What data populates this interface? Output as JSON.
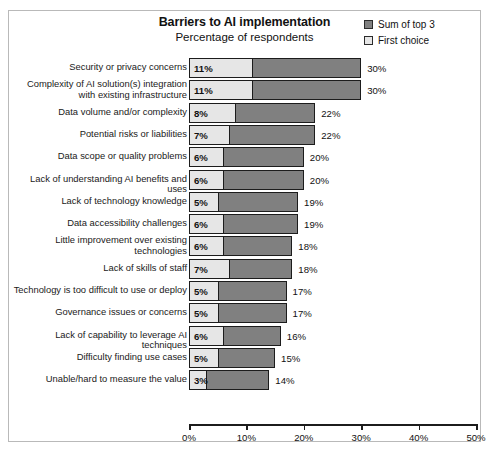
{
  "chart_data": {
    "type": "bar",
    "orientation": "horizontal",
    "stacked": true,
    "title": "Barriers to AI implementation",
    "subtitle": "Percentage of respondents",
    "xlabel": "",
    "ylabel": "",
    "xlim": [
      0,
      50
    ],
    "xticks": [
      "0%",
      "10%",
      "20%",
      "30%",
      "40%",
      "50%"
    ],
    "xtick_values": [
      0,
      10,
      20,
      30,
      40,
      50
    ],
    "grid": false,
    "legend_position": "top-right",
    "legend": [
      {
        "name": "Sum of top 3",
        "color": "#808080"
      },
      {
        "name": "First choice",
        "color": "#e6e6e6"
      }
    ],
    "categories": [
      "Security or privacy concerns",
      "Complexity of AI solution(s) integration with existing infrastructure",
      "Data volume and/or complexity",
      "Potential risks or liabilities",
      "Data scope or quality problems",
      "Lack of understanding AI benefits and uses",
      "Lack of technology knowledge",
      "Data accessibility challenges",
      "Little improvement over existing technologies",
      "Lack of skills of staff",
      "Technology is too difficult to use or deploy",
      "Governance issues or concerns",
      "Lack of capability to leverage AI techniques",
      "Difficulty finding use cases",
      "Unable/hard to measure the value"
    ],
    "series": [
      {
        "name": "First choice",
        "values": [
          11,
          11,
          8,
          7,
          6,
          6,
          5,
          6,
          6,
          7,
          5,
          5,
          6,
          5,
          3
        ],
        "labels": [
          "11%",
          "11%",
          "8%",
          "7%",
          "6%",
          "6%",
          "5%",
          "6%",
          "6%",
          "7%",
          "5%",
          "5%",
          "6%",
          "5%",
          "3%"
        ]
      },
      {
        "name": "Sum of top 3",
        "values": [
          30,
          30,
          22,
          22,
          20,
          20,
          19,
          19,
          18,
          18,
          17,
          17,
          16,
          15,
          14
        ],
        "labels": [
          "30%",
          "30%",
          "22%",
          "22%",
          "20%",
          "20%",
          "19%",
          "19%",
          "18%",
          "18%",
          "17%",
          "17%",
          "16%",
          "15%",
          "14%"
        ]
      }
    ]
  },
  "rows": [
    {
      "label": "Security or privacy concerns",
      "first": 11,
      "first_label": "11%",
      "total": 30,
      "total_label": "30%",
      "lines": 1
    },
    {
      "label": "Complexity of AI solution(s) integration with existing infrastructure",
      "first": 11,
      "first_label": "11%",
      "total": 30,
      "total_label": "30%",
      "lines": 2
    },
    {
      "label": "Data volume and/or complexity",
      "first": 8,
      "first_label": "8%",
      "total": 22,
      "total_label": "22%",
      "lines": 1
    },
    {
      "label": "Potential risks or liabilities",
      "first": 7,
      "first_label": "7%",
      "total": 22,
      "total_label": "22%",
      "lines": 1
    },
    {
      "label": "Data scope or quality problems",
      "first": 6,
      "first_label": "6%",
      "total": 20,
      "total_label": "20%",
      "lines": 1
    },
    {
      "label": "Lack of understanding AI benefits and uses",
      "first": 6,
      "first_label": "6%",
      "total": 20,
      "total_label": "20%",
      "lines": 1
    },
    {
      "label": "Lack of technology knowledge",
      "first": 5,
      "first_label": "5%",
      "total": 19,
      "total_label": "19%",
      "lines": 1
    },
    {
      "label": "Data accessibility challenges",
      "first": 6,
      "first_label": "6%",
      "total": 19,
      "total_label": "19%",
      "lines": 1
    },
    {
      "label": "Little improvement over existing technologies",
      "first": 6,
      "first_label": "6%",
      "total": 18,
      "total_label": "18%",
      "lines": 2
    },
    {
      "label": "Lack of skills of staff",
      "first": 7,
      "first_label": "7%",
      "total": 18,
      "total_label": "18%",
      "lines": 1
    },
    {
      "label": "Technology is too difficult to use or deploy",
      "first": 5,
      "first_label": "5%",
      "total": 17,
      "total_label": "17%",
      "lines": 1
    },
    {
      "label": "Governance issues or concerns",
      "first": 5,
      "first_label": "5%",
      "total": 17,
      "total_label": "17%",
      "lines": 1
    },
    {
      "label": "Lack of capability to leverage AI techniques",
      "first": 6,
      "first_label": "6%",
      "total": 16,
      "total_label": "16%",
      "lines": 1
    },
    {
      "label": "Difficulty finding use cases",
      "first": 5,
      "first_label": "5%",
      "total": 15,
      "total_label": "15%",
      "lines": 1
    },
    {
      "label": "Unable/hard to measure the value",
      "first": 3,
      "first_label": "3%",
      "total": 14,
      "total_label": "14%",
      "lines": 1
    }
  ],
  "axis": {
    "ticks": [
      "0%",
      "10%",
      "20%",
      "30%",
      "40%",
      "50%"
    ],
    "values": [
      0,
      10,
      20,
      30,
      40,
      50
    ]
  },
  "colors": {
    "sum_of_top3": "#808080",
    "first_choice": "#e6e6e6",
    "outline": "#1c1c1c",
    "frame": "#b9b9b9"
  }
}
